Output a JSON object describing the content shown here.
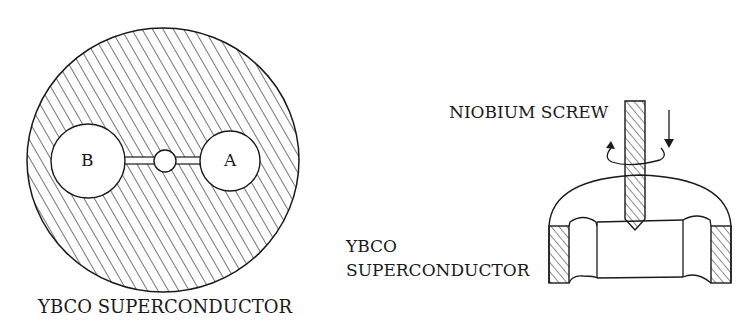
{
  "figure": {
    "left_panel": {
      "caption": "YBCO SUPERCONDUCTOR",
      "cavity_b_label": "B",
      "cavity_a_label": "A"
    },
    "right_panel": {
      "screw_label": "NIOBIUM SCREW",
      "material_label_line1": "YBCO",
      "material_label_line2": "SUPERCONDUCTOR"
    },
    "colors": {
      "ink": "#1a1a1a",
      "background": "#ffffff"
    }
  }
}
